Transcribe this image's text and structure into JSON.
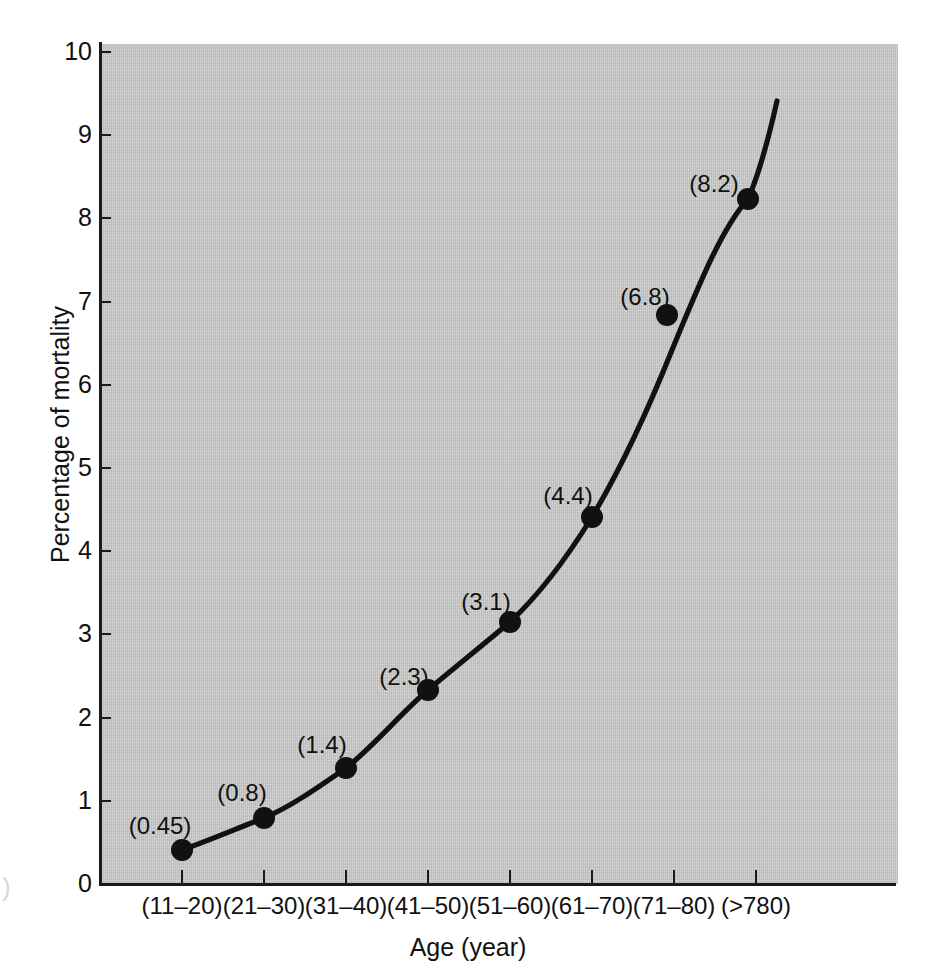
{
  "figure": {
    "background_color": "#ffffff",
    "panel_color": "#c9c9c9",
    "ink_color": "#111111"
  },
  "chart_data": {
    "type": "line",
    "title": "",
    "xlabel": "Age (year)",
    "ylabel": "Percentage of mortality",
    "categories": [
      "(11–20)",
      "(21–30)",
      "(31–40)",
      "(41–50)",
      "(51–60)",
      "(61–70)",
      "(71–80)",
      "(>780)"
    ],
    "values": [
      0.45,
      0.8,
      1.4,
      2.3,
      3.1,
      4.4,
      6.8,
      8.2
    ],
    "point_labels": [
      "(0.45)",
      "(0.8)",
      "(1.4)",
      "(2.3)",
      "(3.1)",
      "(4.4)",
      "(6.8)",
      "(8.2)"
    ],
    "ylim": [
      0,
      10
    ],
    "ytick_labels": [
      "0",
      "1",
      "2",
      "3",
      "4",
      "5",
      "6",
      "7",
      "8",
      "9",
      "10"
    ],
    "ytick_values": [
      0,
      1,
      2,
      3,
      4,
      5,
      6,
      7,
      8,
      9,
      10
    ],
    "grid": false,
    "legend": "none",
    "marker": "filled-circle",
    "line_style": "solid smooth curve, extends above the final marker to about 9.4"
  },
  "geometry": {
    "panel": {
      "left": 100,
      "top": 44,
      "width": 798,
      "height": 840
    },
    "y_axis_x": 100,
    "x_axis_y": 884,
    "y_top_value_px": 52,
    "y_zero_px": 884,
    "x_positions_px": [
      182,
      264,
      346,
      428,
      510,
      592,
      674,
      756
    ],
    "point_px": [
      {
        "x": 182,
        "y": 850
      },
      {
        "x": 264,
        "y": 818
      },
      {
        "x": 346,
        "y": 768
      },
      {
        "x": 428,
        "y": 690
      },
      {
        "x": 510,
        "y": 622
      },
      {
        "x": 592,
        "y": 517
      },
      {
        "x": 667,
        "y": 315
      },
      {
        "x": 748,
        "y": 199
      }
    ],
    "label_px": [
      {
        "x": 160,
        "y": 826
      },
      {
        "x": 242,
        "y": 793
      },
      {
        "x": 322,
        "y": 745
      },
      {
        "x": 404,
        "y": 677
      },
      {
        "x": 486,
        "y": 602
      },
      {
        "x": 568,
        "y": 496
      },
      {
        "x": 645,
        "y": 297
      },
      {
        "x": 714,
        "y": 184
      }
    ],
    "curve_path": "M 182 850 C 210 840, 238 828, 264 818 C 292 806, 320 786, 346 768 C 374 746, 402 712, 428 690 C 454 668, 484 644, 510 622 C 540 594, 568 556, 592 517 C 620 470, 648 410, 672 350 C 700 282, 722 228, 748 199 C 760 172, 770 132, 777 101",
    "curve_top_px": {
      "x": 777,
      "y": 101
    }
  }
}
